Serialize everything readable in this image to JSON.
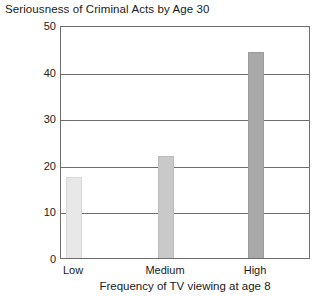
{
  "chart_data": {
    "type": "bar",
    "title": "Seriousness of Criminal Acts by Age 30",
    "xlabel": "Frequency of TV viewing at age 8",
    "ylabel": "",
    "categories": [
      "Low",
      "Medium",
      "High"
    ],
    "values": [
      17.5,
      22.0,
      44.5
    ],
    "ylim": [
      0,
      50
    ],
    "yticks": [
      0,
      10,
      20,
      30,
      40,
      50
    ],
    "ytick_labels": [
      "0",
      "10",
      "20",
      "30",
      "40",
      "50"
    ],
    "grid": true,
    "legend": false,
    "bar_colors": [
      "#e8e8e8",
      "#c9c9c9",
      "#a9a9a9"
    ],
    "bar_edge_colors": [
      "#d8d8d8",
      "#bcbcbc",
      "#9c9c9c"
    ],
    "axis_color": "#6e6e6e",
    "background": "#ffffff"
  }
}
